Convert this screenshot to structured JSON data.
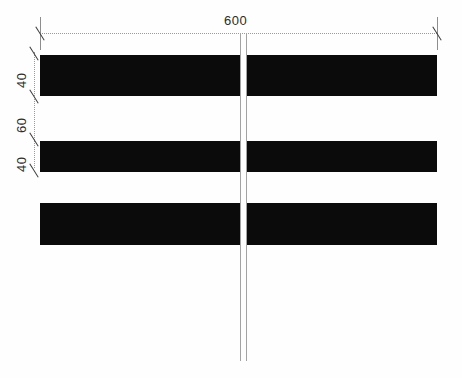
{
  "drawing": {
    "title": "dimensioned-bar-section",
    "background_color": "#fefefe",
    "bar_color": "#0b0b0b",
    "line_color": "#8e8e8e",
    "text_color": "#2b2b2b"
  },
  "dimensions": {
    "horizontal": {
      "label": "600",
      "orientation": "horizontal",
      "position": "top"
    },
    "vertical": [
      {
        "label": "40",
        "orientation": "vertical",
        "segment": "upper-bar-height"
      },
      {
        "label": "60",
        "orientation": "vertical",
        "segment": "gap-between-bars"
      },
      {
        "label": "40",
        "orientation": "vertical",
        "segment": "lower-bar-height"
      }
    ]
  },
  "bars": [
    {
      "name": "bar-top"
    },
    {
      "name": "bar-middle"
    },
    {
      "name": "bar-bottom"
    }
  ],
  "centerline": {
    "name": "vertical-centerline",
    "style": "double-line"
  }
}
